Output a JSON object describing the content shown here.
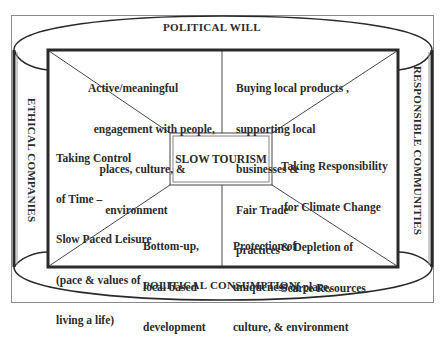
{
  "diagram": {
    "center": {
      "label": "SLOW TOURISM"
    },
    "rings": {
      "top": "POLITICAL WILL",
      "bottom": "POLITICAL CONSUMPTION",
      "left": "ETHICAL COMPANIES",
      "right": "RESPONSIBLE COMMUNITIES"
    },
    "segments": [
      {
        "id": "top-left",
        "lines": [
          "Active/meaningful",
          "  engagement with people,",
          "    places, culture, &",
          "      environment"
        ]
      },
      {
        "id": "top-right",
        "lines": [
          "Buying local products ,",
          "supporting local",
          "businesses &",
          "Fair Trade",
          "practices"
        ]
      },
      {
        "id": "left",
        "lines": [
          "Taking Control",
          "of Time –",
          "Slow Paced Leisure",
          "(pace & values of",
          "living a life)"
        ]
      },
      {
        "id": "right",
        "lines": [
          "Taking Responsibility",
          " for Climate Change",
          "& Depletion of",
          "Scarce Resources"
        ]
      },
      {
        "id": "bottom-left",
        "lines": [
          "Bottom-up,",
          "local based",
          "development"
        ]
      },
      {
        "id": "bottom-right",
        "lines": [
          "Protection of",
          "uniqueness of place,",
          "culture, & environment"
        ]
      }
    ],
    "colors": {
      "line": "#2a2a2a",
      "frame": "#7a7a7a",
      "background": "#ffffff"
    }
  }
}
